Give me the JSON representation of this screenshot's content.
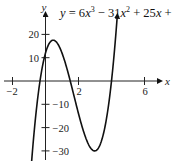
{
  "chart_data": {
    "type": "line",
    "equation_display": "y = 6x³ − 31x² + 25x +",
    "xlabel": "x",
    "ylabel": "y",
    "xlim": [
      -2.2,
      7.5
    ],
    "ylim": [
      -33,
      25
    ],
    "x_ticks": [
      -2,
      2,
      6
    ],
    "x_tick_labels": [
      "−2",
      "2",
      "6"
    ],
    "y_ticks": [
      20,
      10,
      -10,
      -20,
      -30
    ],
    "y_tick_labels": [
      "20",
      "10",
      "−10",
      "−20",
      "−30"
    ],
    "grid": false,
    "legend": null,
    "series": [
      {
        "name": "y = 6x^3 - 31x^2 + 25x + 12",
        "coefficients": [
          6,
          -31,
          25,
          12
        ],
        "x_range": [
          -0.85,
          4.35
        ],
        "key_points": [
          {
            "label": "root",
            "x": -0.333,
            "y": 0
          },
          {
            "label": "y-intercept",
            "x": 0,
            "y": 12
          },
          {
            "label": "local max",
            "x": 0.46,
            "y": 17.4
          },
          {
            "label": "root",
            "x": 1.5,
            "y": 0
          },
          {
            "label": "local min",
            "x": 2.99,
            "y": -30
          },
          {
            "label": "root",
            "x": 4,
            "y": 0
          }
        ]
      }
    ]
  },
  "equation": {
    "lhs": "y",
    "eq": " = 6",
    "x1": "x",
    "exp3": "3",
    "minus31": " − 31",
    "x2": "x",
    "exp2": "2",
    "plus25": " + 25",
    "x3": "x",
    "plus": " +"
  },
  "axes": {
    "x_name": "x",
    "y_name": "y"
  }
}
